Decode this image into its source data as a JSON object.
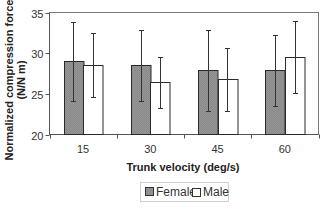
{
  "chart_data": {
    "type": "bar",
    "title": "",
    "xlabel": "Trunk velocity (deg/s)",
    "ylabel_lines": [
      "Normalized compression force",
      "(N/N m)"
    ],
    "ylabel": "Normalized compression force (N/N m)",
    "categories": [
      "15",
      "30",
      "45",
      "60"
    ],
    "ylim": [
      20,
      35
    ],
    "yticks": [
      20,
      25,
      30,
      35
    ],
    "ytick_labels": [
      "20",
      "25",
      "30",
      "35"
    ],
    "grid": false,
    "legend_position": "bottom-center",
    "series": [
      {
        "name": "Female",
        "color": "#8c8c8c",
        "values": [
          29.0,
          28.5,
          27.9,
          27.9
        ],
        "error_upper": [
          33.8,
          32.8,
          32.9,
          32.2
        ],
        "error_lower": [
          24.1,
          24.1,
          22.9,
          23.5
        ]
      },
      {
        "name": "Male",
        "color": "#ffffff",
        "values": [
          28.6,
          26.5,
          26.8,
          29.5
        ],
        "error_upper": [
          32.5,
          29.5,
          30.6,
          34.0
        ],
        "error_lower": [
          24.6,
          23.2,
          22.9,
          25.1
        ]
      }
    ]
  }
}
